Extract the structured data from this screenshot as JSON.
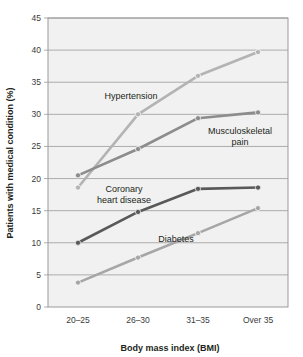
{
  "chart_data": {
    "type": "line",
    "title": "",
    "xlabel": "Body mass index (BMI)",
    "ylabel": "Patients with medical condition (%)",
    "categories": [
      "20–25",
      "26–30",
      "31–35",
      "Over 35"
    ],
    "ylim": [
      0,
      45
    ],
    "yticks": [
      0,
      5,
      10,
      15,
      20,
      25,
      30,
      35,
      40,
      45
    ],
    "ytick_labels": [
      "0",
      "5",
      "10",
      "15",
      "20",
      "25",
      "30",
      "35",
      "40",
      "45"
    ],
    "grid": true,
    "legend_position": "inline-annotations",
    "series": [
      {
        "name": "Hypertension",
        "values": [
          18.6,
          30.0,
          36.0,
          39.7
        ],
        "color": "#b3b3b3",
        "label_x": 131,
        "label_y": 99
      },
      {
        "name": "Musculoskeletal pain",
        "values": [
          20.5,
          24.6,
          29.4,
          30.3
        ],
        "color": "#8c8c8c",
        "label_lines": [
          "Musculoskeletal",
          "pain"
        ],
        "label_x": 240,
        "label_y": 134
      },
      {
        "name": "Coronary heart disease",
        "values": [
          10.0,
          14.8,
          18.4,
          18.6
        ],
        "color": "#595959",
        "label_lines": [
          "Coronary",
          "heart disease"
        ],
        "label_x": 124,
        "label_y": 192
      },
      {
        "name": "Diabetes",
        "values": [
          3.8,
          7.7,
          11.5,
          15.4
        ],
        "color": "#a6a6a6",
        "label_x": 176,
        "label_y": 242
      }
    ]
  },
  "annotations": {
    "hypertension": "Hypertension",
    "musculoskeletal_line1": "Musculoskeletal",
    "musculoskeletal_line2": "pain",
    "coronary_line1": "Coronary",
    "coronary_line2": "heart disease",
    "diabetes": "Diabetes"
  },
  "axes": {
    "y_title": "Patients with medical condition (%)",
    "x_title": "Body mass index (BMI)",
    "y_ticks": [
      "45",
      "40",
      "35",
      "30",
      "25",
      "20",
      "15",
      "10",
      "5",
      "0"
    ],
    "x_ticks": [
      "20–25",
      "26–30",
      "31–35",
      "Over 35"
    ]
  },
  "colors": {
    "plot_background": "#f1f1f1",
    "grid_line": "#9a9a9a",
    "plot_border": "#9a9a9a",
    "text": "#231f20"
  }
}
